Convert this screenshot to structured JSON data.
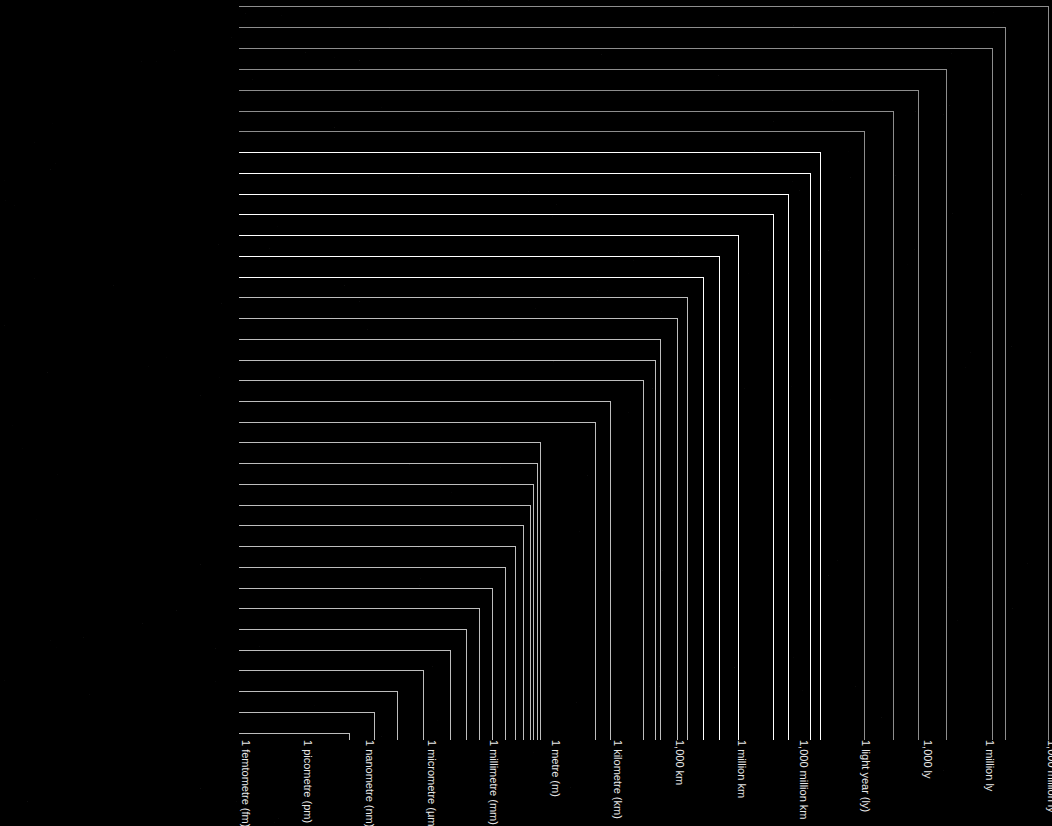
{
  "figure": {
    "background_color": "#000000",
    "axis_label_color": "#e8e8e8",
    "dim_color": "#8d8d8d",
    "mid_color": "#bdbdbd",
    "bright_color": "#ffffff"
  },
  "chart_data": {
    "type": "bar",
    "orientation": "horizontal",
    "scale": "log10",
    "title": "",
    "xlabel": "",
    "ylabel": "",
    "grid": false,
    "legend": null,
    "axis_ticks": [
      {
        "label": "1 femtometre (fm)",
        "exponent": -15,
        "x": 240
      },
      {
        "label": "1 picometre (pm)",
        "exponent": -12,
        "x": 302
      },
      {
        "label": "1 nanometre (nm)",
        "exponent": -9,
        "x": 364
      },
      {
        "label": "1 micrometre (µm)",
        "exponent": -6,
        "x": 426
      },
      {
        "label": "1 millimetre (mm)",
        "exponent": -3,
        "x": 488
      },
      {
        "label": "1 metre (m)",
        "exponent": 0,
        "x": 550
      },
      {
        "label": "1 kilometre (km)",
        "exponent": 3,
        "x": 612
      },
      {
        "label": "1,000 km",
        "exponent": 6,
        "x": 674
      },
      {
        "label": "1 million km",
        "exponent": 9,
        "x": 736
      },
      {
        "label": "1,000 million km",
        "exponent": 12,
        "x": 798
      },
      {
        "label": "1 light year (ly)",
        "exponent": 16,
        "x": 860
      },
      {
        "label": "1,000 ly",
        "exponent": 19,
        "x": 922
      },
      {
        "label": "1 million ly",
        "exponent": 22,
        "x": 984
      },
      {
        "label": "1,000 million ly",
        "exponent": 25,
        "x": 1046
      }
    ],
    "categories": [
      "Distance to Quasar 1007 + 417",
      "Distance to Centauras A",
      "Distance to the Andromeda Galaxy",
      "Distance to Tucanae 47",
      "Distance to the Helix Nebula",
      "Distance to Alcor in the Big Dipper",
      "Diameter of the Ring Nebula",
      "Diameter of the Solar System",
      "Distance to Pluto",
      "Distance to Jupiter",
      "Distance to the Sun",
      "Diameter of the Sun",
      "Distance to the Moon",
      "Diameter of Earth",
      "Distance across Antarctica",
      "Length of the Horn of Africa",
      "Length of the B15 Iceberg",
      "Length of the Nile Delta",
      "Distance across Paris",
      "Width of Uluru (Ayers Rock)",
      "Width of the River Thames in London",
      "Length of a human lung",
      "Length of a European mole",
      "Size of a deep-sea Angler fish",
      "Length of a human fetus at 3 months",
      "Width of a heart valve",
      "Size of a Venus flytrap leaf",
      "Length of a clover seed",
      "Width of a housefly's eye",
      "Length of a shark scale",
      "Thickness of a hair",
      "Diameter of a Knotweed pollen grain",
      "Length of an E.coli bacterium",
      "Size of Hepatitis B virus particles",
      "Width of a DNA molecule",
      "Approximate diameter of a gold atom"
    ],
    "rows": [
      {
        "label": "Distance to Quasar 1007 + 417",
        "y": 6,
        "x_end": 1048,
        "emphasis": "dim"
      },
      {
        "label": "Distance to Centauras A",
        "y": 27,
        "x_end": 1005,
        "emphasis": "dim"
      },
      {
        "label": "Distance to the Andromeda Galaxy",
        "y": 48,
        "x_end": 992,
        "emphasis": "dim"
      },
      {
        "label": "Distance to Tucanae 47",
        "y": 69,
        "x_end": 946,
        "emphasis": "dim"
      },
      {
        "label": "Distance to the Helix Nebula",
        "y": 90,
        "x_end": 918,
        "emphasis": "dim"
      },
      {
        "label": "Distance to Alcor in the Big Dipper",
        "y": 111,
        "x_end": 893,
        "emphasis": "dim"
      },
      {
        "label": "Diameter of the Ring Nebula",
        "y": 131,
        "x_end": 864,
        "emphasis": "dim"
      },
      {
        "label": "Diameter of the Solar System",
        "y": 152,
        "x_end": 820,
        "emphasis": "bright"
      },
      {
        "label": "Distance to Pluto",
        "y": 173,
        "x_end": 810,
        "emphasis": "bright"
      },
      {
        "label": "Distance to Jupiter",
        "y": 194,
        "x_end": 788,
        "emphasis": "bright"
      },
      {
        "label": "Distance to the Sun",
        "y": 214,
        "x_end": 773,
        "emphasis": "bright"
      },
      {
        "label": "Diameter of the Sun",
        "y": 235,
        "x_end": 738,
        "emphasis": "bright"
      },
      {
        "label": "Distance to the Moon",
        "y": 256,
        "x_end": 719,
        "emphasis": "bright"
      },
      {
        "label": "Diameter of Earth",
        "y": 277,
        "x_end": 703,
        "emphasis": "bright"
      },
      {
        "label": "Distance across Antarctica",
        "y": 297,
        "x_end": 687,
        "emphasis": "mid"
      },
      {
        "label": "Length of the Horn of Africa",
        "y": 318,
        "x_end": 677,
        "emphasis": "mid"
      },
      {
        "label": "Length of the B15 Iceberg",
        "y": 339,
        "x_end": 660,
        "emphasis": "mid"
      },
      {
        "label": "Length of the Nile Delta",
        "y": 360,
        "x_end": 655,
        "emphasis": "mid"
      },
      {
        "label": "Distance across Paris",
        "y": 380,
        "x_end": 643,
        "emphasis": "mid"
      },
      {
        "label": "Width of Uluru (Ayers Rock)",
        "y": 401,
        "x_end": 610,
        "emphasis": "mid"
      },
      {
        "label": "Width of the River Thames in London",
        "y": 422,
        "x_end": 595,
        "emphasis": "mid"
      },
      {
        "label": "Length of a human lung",
        "y": 442,
        "x_end": 540,
        "emphasis": "mid"
      },
      {
        "label": "Length of a European mole",
        "y": 463,
        "x_end": 537,
        "emphasis": "mid"
      },
      {
        "label": "Size of a deep-sea Angler fish",
        "y": 484,
        "x_end": 533,
        "emphasis": "mid"
      },
      {
        "label": "Length of a human fetus at 3 months",
        "y": 505,
        "x_end": 530,
        "emphasis": "mid"
      },
      {
        "label": "Width of a heart valve",
        "y": 525,
        "x_end": 523,
        "emphasis": "mid"
      },
      {
        "label": "Size of a Venus flytrap leaf",
        "y": 546,
        "x_end": 515,
        "emphasis": "mid"
      },
      {
        "label": "Length of a clover seed",
        "y": 567,
        "x_end": 505,
        "emphasis": "mid"
      },
      {
        "label": "Width of a housefly's eye",
        "y": 588,
        "x_end": 492,
        "emphasis": "mid"
      },
      {
        "label": "Length of a shark scale",
        "y": 608,
        "x_end": 479,
        "emphasis": "mid"
      },
      {
        "label": "Thickness of a hair",
        "y": 629,
        "x_end": 466,
        "emphasis": "mid"
      },
      {
        "label": "Diameter of a Knotweed pollen grain",
        "y": 650,
        "x_end": 450,
        "emphasis": "mid"
      },
      {
        "label": "Length of an E.coli bacterium",
        "y": 670,
        "x_end": 423,
        "emphasis": "mid"
      },
      {
        "label": "Size of Hepatitis B virus particles",
        "y": 691,
        "x_end": 397,
        "emphasis": "mid"
      },
      {
        "label": "Width of a DNA molecule",
        "y": 712,
        "x_end": 374,
        "emphasis": "mid"
      },
      {
        "label": "Approximate diameter of a gold atom",
        "y": 733,
        "x_end": 349,
        "emphasis": "mid"
      }
    ]
  }
}
